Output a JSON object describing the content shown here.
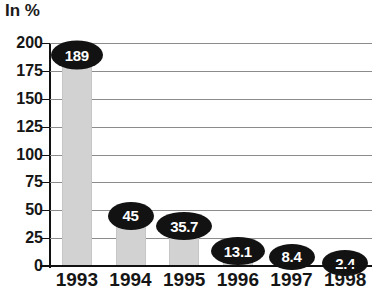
{
  "chart_data": {
    "type": "bar",
    "title": "In %",
    "xlabel": "",
    "ylabel": "In %",
    "categories": [
      "1993",
      "1994",
      "1995",
      "1996",
      "1997",
      "1998"
    ],
    "values": [
      189,
      45,
      35.7,
      13.1,
      8.4,
      2.4
    ],
    "value_labels": [
      "189",
      "45",
      "35.7",
      "13.1",
      "8.4",
      "2.4"
    ],
    "ylim": [
      0,
      200
    ],
    "ytick_labels": [
      "200",
      "175",
      "150",
      "125",
      "100",
      "75",
      "50",
      "25",
      "0"
    ],
    "ytick_values": [
      200,
      175,
      150,
      125,
      100,
      75,
      50,
      25,
      0
    ],
    "grid": true,
    "legend": "none",
    "colors": {
      "bar": "#d2d2d2",
      "label_pill": "#121212",
      "label_text": "#ffffff",
      "gridline": "#8c8c8c",
      "axis": "#111111",
      "text": "#151515",
      "background": "#ffffff"
    }
  }
}
